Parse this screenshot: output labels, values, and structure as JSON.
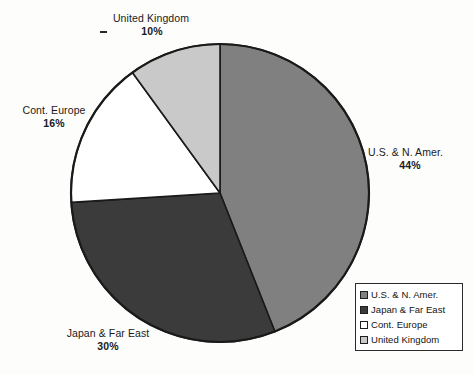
{
  "chart_data": {
    "type": "pie",
    "title": "",
    "subtitle": "",
    "xlabel": "",
    "ylabel": "",
    "grid": false,
    "legend_position": "bottom-right",
    "units": "percent",
    "start_angle_deg": 0,
    "direction": "clockwise",
    "categories": [
      "U.S. & N. Amer.",
      "Japan & Far East",
      "Cont. Europe",
      "United Kingdom"
    ],
    "values": [
      44,
      30,
      16,
      10
    ],
    "slices": [
      {
        "label": "U.S. & N. Amer.",
        "value": 44,
        "value_text": "44%",
        "color": "#808080",
        "start_deg": 0,
        "end_deg": 158.4
      },
      {
        "label": "Japan & Far East",
        "value": 30,
        "value_text": "30%",
        "color": "#3b3b3b",
        "start_deg": 158.4,
        "end_deg": 266.4
      },
      {
        "label": "Cont. Europe",
        "value": 16,
        "value_text": "16%",
        "color": "#ffffff",
        "start_deg": 266.4,
        "end_deg": 324.0
      },
      {
        "label": "United Kingdom",
        "value": 10,
        "value_text": "10%",
        "color": "#c9c9c9",
        "start_deg": 324.0,
        "end_deg": 360.0
      }
    ]
  },
  "callouts": {
    "united_kingdom": {
      "label": "United Kingdom",
      "percent": "10%",
      "leader": "-"
    },
    "cont_europe": {
      "label": "Cont. Europe",
      "percent": "16%"
    },
    "us_n_amer": {
      "label": "U.S. & N. Amer.",
      "percent": "44%"
    },
    "japan_far_east": {
      "label": "Japan & Far East",
      "percent": "30%"
    }
  },
  "legend": {
    "items": [
      {
        "label": "U.S. & N. Amer.",
        "color": "#808080"
      },
      {
        "label": "Japan & Far East",
        "color": "#3b3b3b"
      },
      {
        "label": "Cont. Europe",
        "color": "#ffffff"
      },
      {
        "label": "United Kingdom",
        "color": "#c9c9c9"
      }
    ]
  },
  "style": {
    "background": "#fdfdfc",
    "outline": "#1a1a1a",
    "text": "#1a1a1a"
  },
  "geometry": {
    "center_x": 220,
    "center_y": 193,
    "radius": 149
  }
}
